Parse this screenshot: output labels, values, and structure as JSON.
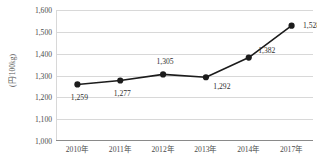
{
  "chart_data": {
    "type": "line",
    "title": "",
    "subtitle": "",
    "xlabel": "",
    "ylabel": "(円/100kg)",
    "categories": [
      "2010年",
      "2011年",
      "2012年",
      "2013年",
      "2014年",
      "2017年"
    ],
    "values": [
      1259,
      1277,
      1305,
      1292,
      1382,
      1528
    ],
    "point_labels": [
      "1,259",
      "1,277",
      "1,305",
      "1,292",
      "1,382",
      "1,528"
    ],
    "label_positions": [
      "below",
      "below",
      "above",
      "below-right",
      "above-right",
      "right"
    ],
    "ylim": [
      1000,
      1600
    ],
    "y_ticks": [
      1600,
      1500,
      1400,
      1300,
      1200,
      1100,
      1000
    ],
    "y_tick_labels": [
      "1,600",
      "1,500",
      "1,400",
      "1,300",
      "1,200",
      "1,100",
      "1,000"
    ],
    "grid": true,
    "legend": false,
    "legend_position": "none",
    "series_color": "#1c1c1c",
    "marker_color": "#1c1c1c",
    "grid_color": "#d8d8d8",
    "axis_color": "#8a8a8a",
    "background_color": "#ffffff"
  }
}
